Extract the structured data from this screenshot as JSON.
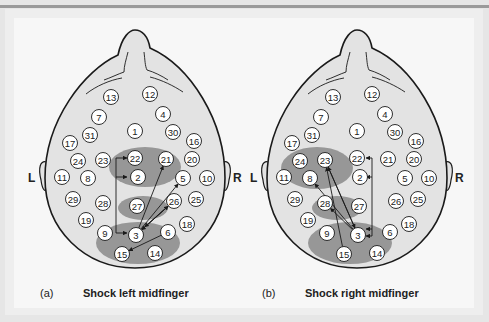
{
  "figure": {
    "side_labels": {
      "left": "L",
      "right": "R"
    },
    "panels": [
      {
        "id": "a",
        "label": "(a)",
        "caption": "Shock left midfinger",
        "offset_x": 0,
        "highlight_regions": [
          {
            "cx": 145,
            "cy": 167,
            "rx": 36,
            "ry": 20
          },
          {
            "cx": 143,
            "cy": 208,
            "rx": 25,
            "ry": 12
          },
          {
            "cx": 138,
            "cy": 243,
            "rx": 42,
            "ry": 21
          }
        ],
        "arrows": [
          {
            "from": 3,
            "to": 21
          },
          {
            "from": 3,
            "to": 5
          },
          {
            "from": 3,
            "to": 26
          },
          {
            "from": 26,
            "to": 3
          },
          {
            "from": 6,
            "to": 15
          },
          {
            "from": 26,
            "to": 3,
            "offset": 1
          }
        ],
        "bracket_arrows": [
          {
            "x": 116,
            "from_y": 236,
            "targets": [
              158,
              177,
              233
            ]
          }
        ]
      },
      {
        "id": "b",
        "label": "(b)",
        "caption": "Shock right midfinger",
        "offset_x": 222,
        "highlight_regions": [
          {
            "cx": 95,
            "cy": 168,
            "rx": 36,
            "ry": 21
          },
          {
            "cx": 115,
            "cy": 208,
            "rx": 25,
            "ry": 12
          },
          {
            "cx": 128,
            "cy": 243,
            "rx": 42,
            "ry": 21
          }
        ],
        "arrows": [
          {
            "from": 3,
            "to": 23
          },
          {
            "from": 15,
            "to": 23
          },
          {
            "from": 3,
            "to": 8
          },
          {
            "from": 3,
            "to": 28
          },
          {
            "from": 23,
            "to": 3
          }
        ],
        "bracket_arrows": [
          {
            "x": 150,
            "from_y": 158,
            "targets": [
              158,
              177,
              229,
              236
            ],
            "side": "right"
          }
        ]
      }
    ],
    "electrodes": [
      {
        "n": "13",
        "x": 111,
        "y": 97
      },
      {
        "n": "12",
        "x": 150,
        "y": 94
      },
      {
        "n": "7",
        "x": 99,
        "y": 117
      },
      {
        "n": "4",
        "x": 163,
        "y": 114
      },
      {
        "n": "1",
        "x": 135,
        "y": 131
      },
      {
        "n": "31",
        "x": 90,
        "y": 135
      },
      {
        "n": "30",
        "x": 173,
        "y": 132
      },
      {
        "n": "17",
        "x": 70,
        "y": 143
      },
      {
        "n": "16",
        "x": 194,
        "y": 141
      },
      {
        "n": "24",
        "x": 78,
        "y": 161
      },
      {
        "n": "23",
        "x": 103,
        "y": 160
      },
      {
        "n": "22",
        "x": 135,
        "y": 158
      },
      {
        "n": "21",
        "x": 166,
        "y": 159
      },
      {
        "n": "20",
        "x": 192,
        "y": 159
      },
      {
        "n": "11",
        "x": 62,
        "y": 177
      },
      {
        "n": "8",
        "x": 88,
        "y": 178
      },
      {
        "n": "2",
        "x": 138,
        "y": 177
      },
      {
        "n": "5",
        "x": 183,
        "y": 178
      },
      {
        "n": "10",
        "x": 207,
        "y": 178
      },
      {
        "n": "29",
        "x": 73,
        "y": 199
      },
      {
        "n": "28",
        "x": 103,
        "y": 203
      },
      {
        "n": "27",
        "x": 137,
        "y": 206
      },
      {
        "n": "26",
        "x": 174,
        "y": 201
      },
      {
        "n": "25",
        "x": 196,
        "y": 199
      },
      {
        "n": "19",
        "x": 86,
        "y": 220
      },
      {
        "n": "18",
        "x": 187,
        "y": 224
      },
      {
        "n": "9",
        "x": 105,
        "y": 233
      },
      {
        "n": "3",
        "x": 136,
        "y": 235
      },
      {
        "n": "6",
        "x": 168,
        "y": 232
      },
      {
        "n": "15",
        "x": 122,
        "y": 254
      },
      {
        "n": "14",
        "x": 155,
        "y": 253
      }
    ]
  },
  "colors": {
    "head_fill": "#e3e3e3",
    "head_stroke": "#1a1a1a",
    "highlight_fill": "#8a8a8a",
    "electrode_fill": "#ffffff",
    "text": "#222222",
    "panel_bg": "#f7f7f7"
  }
}
